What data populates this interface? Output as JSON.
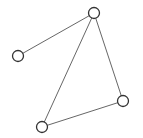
{
  "diagram": {
    "type": "undirected-graph",
    "canvas": {
      "width": 143,
      "height": 138,
      "background": "#ffffff"
    },
    "colors": {
      "edge": "#555555",
      "node_stroke": "#333333",
      "node_fill": "#ffffff"
    },
    "node_radius": 5.5,
    "nodes": [
      {
        "id": "top",
        "x": 94,
        "y": 13
      },
      {
        "id": "left",
        "x": 18,
        "y": 56
      },
      {
        "id": "right",
        "x": 123,
        "y": 101
      },
      {
        "id": "bottom",
        "x": 42,
        "y": 127
      }
    ],
    "edges": [
      {
        "from": "top",
        "to": "left"
      },
      {
        "from": "top",
        "to": "right"
      },
      {
        "from": "top",
        "to": "bottom"
      },
      {
        "from": "right",
        "to": "bottom"
      }
    ]
  }
}
